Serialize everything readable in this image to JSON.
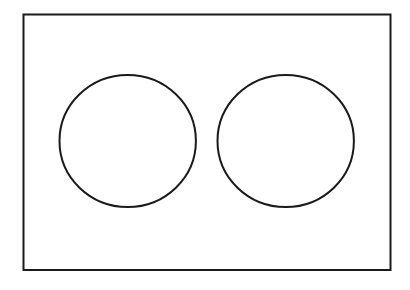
{
  "diagram": {
    "canvas": {
      "width": 410,
      "height": 290,
      "background": "#ffffff"
    },
    "stroke_color": "#1a1a1a",
    "frame": {
      "x": 23.5,
      "y": 14.5,
      "width": 367,
      "height": 255.5,
      "stroke_width": 2
    },
    "circles": [
      {
        "id": "left",
        "cx": 127.7,
        "cy": 141,
        "rx": 68.2,
        "ry": 66,
        "stroke_width": 2
      },
      {
        "id": "right",
        "cx": 285.7,
        "cy": 141,
        "rx": 68.2,
        "ry": 66,
        "stroke_width": 2
      }
    ]
  }
}
